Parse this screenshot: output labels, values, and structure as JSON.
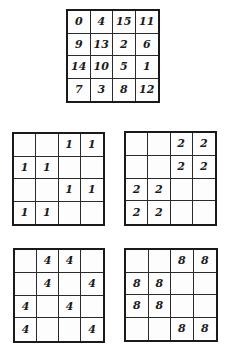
{
  "grids": [
    {
      "id": "grid-main",
      "name": "number-square-grid",
      "cells": [
        [
          "0",
          "4",
          "15",
          "11"
        ],
        [
          "9",
          "13",
          "2",
          "6"
        ],
        [
          "14",
          "10",
          "5",
          "1"
        ],
        [
          "7",
          "3",
          "8",
          "12"
        ]
      ]
    },
    {
      "id": "grid-bit1",
      "name": "bit-1-grid",
      "cells": [
        [
          "",
          "",
          "1",
          "1"
        ],
        [
          "1",
          "1",
          "",
          ""
        ],
        [
          "",
          "",
          "1",
          "1"
        ],
        [
          "1",
          "1",
          "",
          ""
        ]
      ]
    },
    {
      "id": "grid-bit2",
      "name": "bit-2-grid",
      "cells": [
        [
          "",
          "",
          "2",
          "2"
        ],
        [
          "",
          "",
          "2",
          "2"
        ],
        [
          "2",
          "2",
          "",
          ""
        ],
        [
          "2",
          "2",
          "",
          ""
        ]
      ]
    },
    {
      "id": "grid-bit4",
      "name": "bit-4-grid",
      "cells": [
        [
          "",
          "4",
          "4",
          ""
        ],
        [
          "",
          "4",
          "",
          "4"
        ],
        [
          "4",
          "",
          "4",
          ""
        ],
        [
          "4",
          "",
          "",
          "4"
        ]
      ]
    },
    {
      "id": "grid-bit8",
      "name": "bit-8-grid",
      "cells": [
        [
          "",
          "",
          "8",
          "8"
        ],
        [
          "8",
          "8",
          "",
          ""
        ],
        [
          "8",
          "8",
          "",
          ""
        ],
        [
          "",
          "",
          "8",
          "8"
        ]
      ]
    }
  ]
}
